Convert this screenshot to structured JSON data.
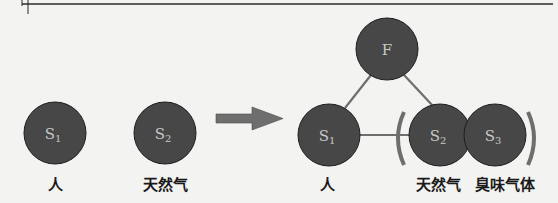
{
  "colors": {
    "node_fill": "#474747",
    "node_stroke": "#1e1e1e",
    "node_text": "#c8c8c8",
    "edge": "#6e6e6e",
    "arrow": "#6e6e6e",
    "paren": "#6e6e6e",
    "rule": "#2a2a2a"
  },
  "left_group": {
    "nodes": [
      {
        "id": "S1",
        "base": "S",
        "sub": "1",
        "label": "人"
      },
      {
        "id": "S2",
        "base": "S",
        "sub": "2",
        "label": "天然气"
      }
    ]
  },
  "arrow": {
    "direction": "right"
  },
  "right_group": {
    "nodes": [
      {
        "id": "F",
        "base": "F",
        "sub": "",
        "label": ""
      },
      {
        "id": "S1",
        "base": "S",
        "sub": "1",
        "label": "人"
      },
      {
        "id": "S2",
        "base": "S",
        "sub": "2",
        "label": "天然气"
      },
      {
        "id": "S3",
        "base": "S",
        "sub": "3",
        "label": "臭味气体"
      }
    ],
    "edges": [
      [
        "F",
        "S1"
      ],
      [
        "F",
        "S2"
      ],
      [
        "S1",
        "S2"
      ]
    ],
    "bracketed": [
      "S2",
      "S3"
    ]
  }
}
